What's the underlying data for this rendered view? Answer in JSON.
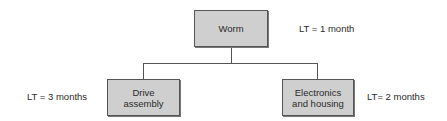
{
  "diagram": {
    "type": "product-structure-tree",
    "colors": {
      "box_fill": "#cfcfcf",
      "box_border": "#555555",
      "line": "#555555",
      "text": "#2b2b2b"
    },
    "root": {
      "label": "Worm",
      "lead_time": "LT = 1 month"
    },
    "children": [
      {
        "label_line1": "Drive",
        "label_line2": "assembly",
        "lead_time": "LT = 3 months"
      },
      {
        "label_line1": "Electronics",
        "label_line2": "and housing",
        "lead_time": "LT= 2 months"
      }
    ]
  }
}
